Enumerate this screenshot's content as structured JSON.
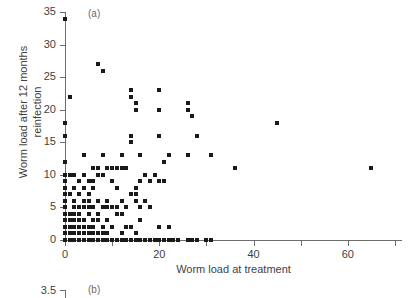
{
  "figure": {
    "background": "#ffffff",
    "point_color": "#1a1a1a",
    "axis_color": "#6d6d6d",
    "text_color": "#3f3f3f"
  },
  "panel_a": {
    "label": "(a)",
    "xlabel": "Worm load at treatment",
    "ylabel_line1": "Worm load after 12 months",
    "ylabel_line2": "reinfection",
    "x_ticks": [
      "0",
      "20",
      "40",
      "60"
    ],
    "y_ticks": [
      "0",
      "5",
      "10",
      "15",
      "20",
      "25",
      "30",
      "35"
    ]
  },
  "panel_b": {
    "label": "(b)",
    "y_tick_top": "3.5"
  },
  "chart_data": {
    "type": "scatter",
    "title": "",
    "subtitle": "",
    "xlabel": "Worm load at treatment",
    "ylabel": "Worm load after 12 months reinfection",
    "xlim": [
      0,
      71.5
    ],
    "ylim": [
      0,
      35
    ],
    "x_ticks": [
      0,
      20,
      40,
      60
    ],
    "y_ticks": [
      0,
      5,
      10,
      15,
      20,
      25,
      30,
      35
    ],
    "grid": false,
    "legend": null,
    "marker": "square",
    "series": [
      {
        "name": "patients",
        "points": [
          [
            0,
            34
          ],
          [
            0,
            18
          ],
          [
            0,
            16
          ],
          [
            0,
            12
          ],
          [
            0,
            10
          ],
          [
            0,
            9
          ],
          [
            0,
            8
          ],
          [
            0,
            7
          ],
          [
            0,
            6
          ],
          [
            0,
            5
          ],
          [
            0,
            4
          ],
          [
            0,
            3
          ],
          [
            0,
            2
          ],
          [
            0,
            1
          ],
          [
            0,
            0
          ],
          [
            1,
            22
          ],
          [
            1,
            10
          ],
          [
            1,
            7
          ],
          [
            1,
            4
          ],
          [
            1,
            3
          ],
          [
            1,
            2
          ],
          [
            1,
            1
          ],
          [
            1,
            0
          ],
          [
            2,
            10
          ],
          [
            2,
            8
          ],
          [
            2,
            6
          ],
          [
            2,
            5
          ],
          [
            2,
            4
          ],
          [
            2,
            3
          ],
          [
            2,
            2
          ],
          [
            2,
            1
          ],
          [
            2,
            0
          ],
          [
            3,
            9
          ],
          [
            3,
            7
          ],
          [
            3,
            5
          ],
          [
            3,
            4
          ],
          [
            3,
            3
          ],
          [
            3,
            2
          ],
          [
            3,
            1
          ],
          [
            3,
            0
          ],
          [
            4,
            13
          ],
          [
            4,
            10
          ],
          [
            4,
            8
          ],
          [
            4,
            6
          ],
          [
            4,
            5
          ],
          [
            4,
            3
          ],
          [
            4,
            2
          ],
          [
            4,
            1
          ],
          [
            4,
            0
          ],
          [
            5,
            9
          ],
          [
            5,
            7
          ],
          [
            5,
            6
          ],
          [
            5,
            5
          ],
          [
            5,
            4
          ],
          [
            5,
            2
          ],
          [
            5,
            1
          ],
          [
            5,
            0
          ],
          [
            6,
            11
          ],
          [
            6,
            9
          ],
          [
            6,
            8
          ],
          [
            6,
            5
          ],
          [
            6,
            3
          ],
          [
            6,
            2
          ],
          [
            6,
            1
          ],
          [
            6,
            0
          ],
          [
            7,
            27
          ],
          [
            7,
            11
          ],
          [
            7,
            10
          ],
          [
            7,
            6
          ],
          [
            7,
            4
          ],
          [
            7,
            3
          ],
          [
            7,
            1
          ],
          [
            7,
            0
          ],
          [
            8,
            26
          ],
          [
            8,
            13
          ],
          [
            8,
            10
          ],
          [
            8,
            5
          ],
          [
            8,
            2
          ],
          [
            8,
            1
          ],
          [
            8,
            0
          ],
          [
            9,
            11
          ],
          [
            9,
            6
          ],
          [
            9,
            5
          ],
          [
            9,
            3
          ],
          [
            9,
            1
          ],
          [
            9,
            0
          ],
          [
            10,
            11
          ],
          [
            10,
            9
          ],
          [
            10,
            5
          ],
          [
            10,
            2
          ],
          [
            10,
            0
          ],
          [
            11,
            11
          ],
          [
            11,
            8
          ],
          [
            11,
            5
          ],
          [
            11,
            4
          ],
          [
            11,
            0
          ],
          [
            12,
            13
          ],
          [
            12,
            11
          ],
          [
            12,
            6
          ],
          [
            12,
            4
          ],
          [
            12,
            1
          ],
          [
            12,
            0
          ],
          [
            13,
            11
          ],
          [
            13,
            5
          ],
          [
            13,
            2
          ],
          [
            13,
            0
          ],
          [
            14,
            23
          ],
          [
            14,
            22
          ],
          [
            14,
            16
          ],
          [
            14,
            15
          ],
          [
            14,
            7
          ],
          [
            14,
            2
          ],
          [
            14,
            0
          ],
          [
            15,
            21
          ],
          [
            15,
            20
          ],
          [
            15,
            8
          ],
          [
            15,
            7
          ],
          [
            15,
            6
          ],
          [
            15,
            1
          ],
          [
            15,
            0
          ],
          [
            16,
            13
          ],
          [
            16,
            9
          ],
          [
            16,
            5
          ],
          [
            16,
            3
          ],
          [
            16,
            0
          ],
          [
            17,
            10
          ],
          [
            17,
            6
          ],
          [
            17,
            0
          ],
          [
            18,
            9
          ],
          [
            18,
            5
          ],
          [
            18,
            0
          ],
          [
            19,
            10
          ],
          [
            19,
            0
          ],
          [
            20,
            23
          ],
          [
            20,
            20
          ],
          [
            20,
            16
          ],
          [
            20,
            9
          ],
          [
            20,
            9
          ],
          [
            20,
            2
          ],
          [
            20,
            0
          ],
          [
            21,
            12
          ],
          [
            21,
            9
          ],
          [
            21,
            0
          ],
          [
            22,
            13
          ],
          [
            22,
            2
          ],
          [
            22,
            0
          ],
          [
            23,
            0
          ],
          [
            24,
            0
          ],
          [
            26,
            21
          ],
          [
            26,
            20
          ],
          [
            26,
            13
          ],
          [
            26,
            0
          ],
          [
            27,
            19
          ],
          [
            27,
            0
          ],
          [
            28,
            16
          ],
          [
            28,
            0
          ],
          [
            30,
            0
          ],
          [
            31,
            13
          ],
          [
            31,
            0
          ],
          [
            36,
            11
          ],
          [
            45,
            18
          ],
          [
            65,
            11
          ]
        ]
      }
    ]
  }
}
